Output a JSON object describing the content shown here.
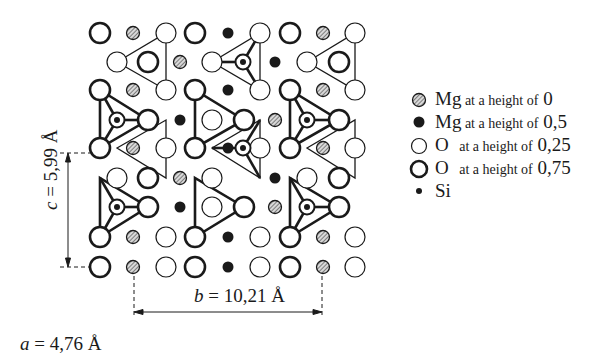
{
  "legend": {
    "items": [
      {
        "symbol": "hatched-circle",
        "element": "Mg",
        "text": "at a height of",
        "value": "0"
      },
      {
        "symbol": "black-dot",
        "element": "Mg",
        "text": "at a height of",
        "value": "0,5"
      },
      {
        "symbol": "thin-circle",
        "element": "O",
        "text": "at a height of",
        "value": "0,25"
      },
      {
        "symbol": "thick-circle",
        "element": "O",
        "text": "at a height of",
        "value": "0,75"
      },
      {
        "symbol": "small-dot",
        "element": "Si",
        "text": "",
        "value": ""
      }
    ]
  },
  "dimensions": {
    "c": {
      "var": "c",
      "eq": " = 5,99 Å"
    },
    "b": {
      "var": "b",
      "eq": " = 10,21 Å"
    },
    "a": {
      "var": "a",
      "eq": " = 4,76 Å"
    }
  },
  "colors": {
    "ink": "#1a1a1a",
    "hatch": "#8a8a8a",
    "background": "#ffffff"
  }
}
